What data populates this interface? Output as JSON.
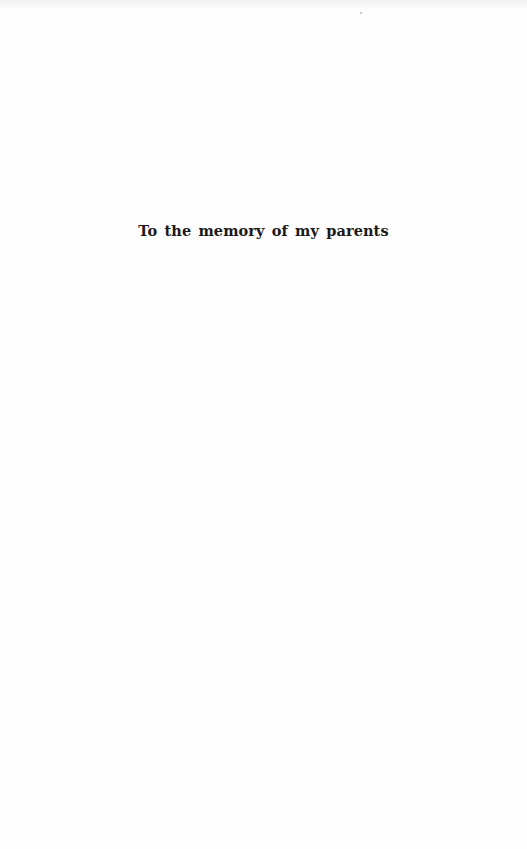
{
  "page": {
    "dedication": "To the memory of my parents"
  }
}
